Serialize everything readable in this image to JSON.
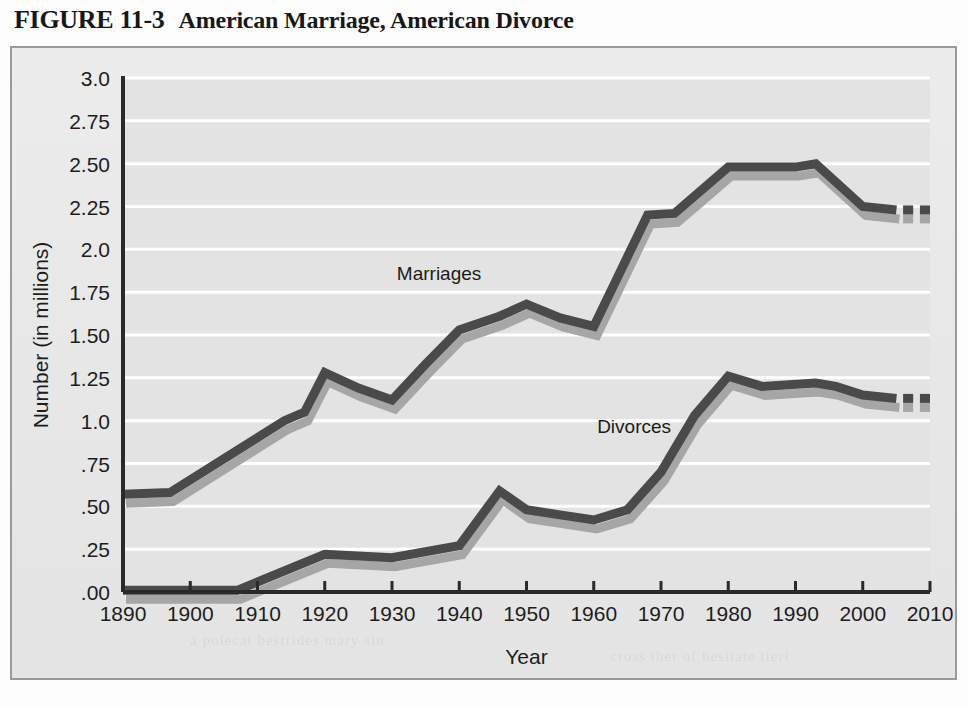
{
  "figure": {
    "number": "FIGURE 11-3",
    "title": "American Marriage, American Divorce"
  },
  "colors": {
    "series_main": "#4a4a4a",
    "series_shadow": "#a6a6a6",
    "panel_bg": "#e3e3e3",
    "frame_border": "#9a9a9a",
    "gridline": "#ffffff",
    "axis": "#2a2a2a",
    "text": "#1d1d1d"
  },
  "ghost_text": {
    "line1": "a  polecat  bestrides  mary  sin",
    "line2": "cross  ther  of  hesitate  tieri"
  },
  "chart_data": {
    "type": "line",
    "title": "American Marriage, American Divorce",
    "xlabel": "Year",
    "ylabel": "Number (in millions)",
    "xlim": [
      1890,
      2010
    ],
    "ylim": [
      0,
      3.0
    ],
    "grid": true,
    "legend": "inline-labels",
    "x_ticks": [
      1890,
      1900,
      1910,
      1920,
      1930,
      1940,
      1950,
      1960,
      1970,
      1980,
      1990,
      2000,
      2010
    ],
    "x_tick_labels": [
      "1890",
      "1900",
      "1910",
      "1920",
      "1930",
      "1940",
      "1950",
      "1960",
      "1970",
      "1980",
      "1990",
      "2000",
      "2010"
    ],
    "y_ticks": [
      0,
      0.25,
      0.5,
      0.75,
      1.0,
      1.25,
      1.5,
      1.75,
      2.0,
      2.25,
      2.5,
      2.75,
      3.0
    ],
    "y_tick_labels": [
      ".00",
      ".25",
      ".50",
      ".75",
      "1.0",
      "1.25",
      "1.50",
      "1.75",
      "2.0",
      "2.25",
      "2.50",
      "2.75",
      "3.0"
    ],
    "series": [
      {
        "name": "Marriages",
        "label": "Marriages",
        "label_x": 1937,
        "label_y": 1.82,
        "solid": [
          {
            "x": 1890,
            "y": 0.57
          },
          {
            "x": 1897,
            "y": 0.58
          },
          {
            "x": 1914,
            "y": 1.0
          },
          {
            "x": 1917,
            "y": 1.05
          },
          {
            "x": 1920,
            "y": 1.28
          },
          {
            "x": 1925,
            "y": 1.19
          },
          {
            "x": 1930,
            "y": 1.12
          },
          {
            "x": 1935,
            "y": 1.33
          },
          {
            "x": 1940,
            "y": 1.53
          },
          {
            "x": 1946,
            "y": 1.61
          },
          {
            "x": 1950,
            "y": 1.68
          },
          {
            "x": 1955,
            "y": 1.6
          },
          {
            "x": 1960,
            "y": 1.55
          },
          {
            "x": 1968,
            "y": 2.2
          },
          {
            "x": 1972,
            "y": 2.21
          },
          {
            "x": 1980,
            "y": 2.48
          },
          {
            "x": 1990,
            "y": 2.48
          },
          {
            "x": 1993,
            "y": 2.5
          },
          {
            "x": 2000,
            "y": 2.25
          },
          {
            "x": 2005,
            "y": 2.23
          }
        ],
        "dashes": [
          {
            "x1": 2006,
            "x2": 2007.5,
            "y": 2.23
          },
          {
            "x1": 2008.5,
            "x2": 2010,
            "y": 2.23
          }
        ]
      },
      {
        "name": "Divorces",
        "label": "Divorces",
        "label_x": 1966,
        "label_y": 0.93,
        "solid": [
          {
            "x": 1890,
            "y": 0.01
          },
          {
            "x": 1907,
            "y": 0.01
          },
          {
            "x": 1920,
            "y": 0.22
          },
          {
            "x": 1930,
            "y": 0.2
          },
          {
            "x": 1940,
            "y": 0.27
          },
          {
            "x": 1946,
            "y": 0.59
          },
          {
            "x": 1950,
            "y": 0.48
          },
          {
            "x": 1955,
            "y": 0.45
          },
          {
            "x": 1960,
            "y": 0.42
          },
          {
            "x": 1965,
            "y": 0.48
          },
          {
            "x": 1970,
            "y": 0.7
          },
          {
            "x": 1975,
            "y": 1.03
          },
          {
            "x": 1980,
            "y": 1.26
          },
          {
            "x": 1985,
            "y": 1.2
          },
          {
            "x": 1993,
            "y": 1.22
          },
          {
            "x": 1996,
            "y": 1.2
          },
          {
            "x": 2000,
            "y": 1.15
          },
          {
            "x": 2005,
            "y": 1.13
          }
        ],
        "dashes": [
          {
            "x1": 2006,
            "x2": 2007.5,
            "y": 1.13
          },
          {
            "x1": 2008.5,
            "x2": 2010,
            "y": 1.13
          }
        ]
      }
    ]
  }
}
